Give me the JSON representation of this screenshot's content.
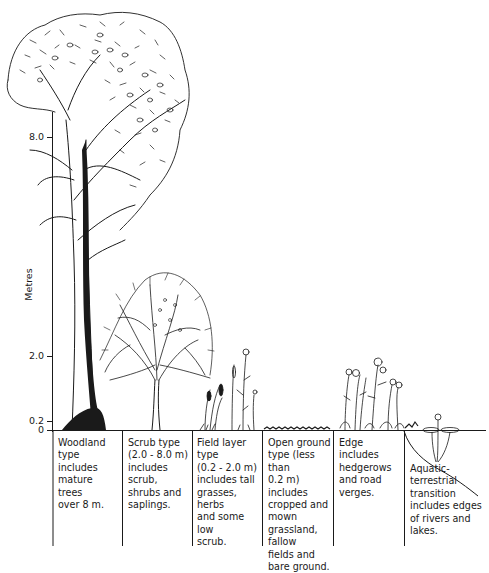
{
  "figure": {
    "axis": {
      "title": "Metres",
      "ticks": [
        {
          "label": "8.0",
          "y": 137
        },
        {
          "label": "2.0",
          "y": 356
        },
        {
          "label": "0.2",
          "y": 421
        },
        {
          "label": "0",
          "y": 430
        }
      ]
    },
    "habitat_types": [
      {
        "id": "woodland",
        "description": "Woodland type includes mature trees over 8 m.",
        "lines": [
          "Woodland",
          "type includes",
          "mature trees",
          "over 8 m."
        ]
      },
      {
        "id": "scrub",
        "description": "Scrub type (2.0 - 8.0 m) includes scrub, shrubs and saplings.",
        "lines": [
          "Scrub type",
          "(2.0 - 8.0 m)",
          "includes scrub,",
          "shrubs and",
          "saplings."
        ]
      },
      {
        "id": "field-layer",
        "description": "Field layer type (0.2 - 2.0 m) includes tall grasses, herbs and some low scrub.",
        "lines": [
          "Field layer type",
          "(0.2 - 2.0 m)",
          "includes tall",
          "grasses, herbs",
          "and some low",
          "scrub."
        ]
      },
      {
        "id": "open-ground",
        "description": "Open ground type (less than 0.2 m) includes cropped and mown grassland, fallow fields and bare ground.",
        "lines": [
          "Open ground",
          "type (less than",
          "0.2 m) includes",
          "cropped and",
          "mown",
          "grassland, fallow",
          "fields and",
          "bare ground."
        ]
      },
      {
        "id": "edge",
        "description": "Edge includes hedgerows and road verges.",
        "lines": [
          "Edge includes",
          "hedgerows",
          "and road",
          "verges."
        ]
      },
      {
        "id": "aquatic-terrestrial",
        "description": "Aquatic-terrestrial transition includes edges of rivers and lakes.",
        "lines": [
          "Aquatic-",
          "terrestrial",
          "transition",
          "includes edges",
          "of rivers and",
          "lakes."
        ]
      }
    ],
    "colors": {
      "ink": "#1a1a1a",
      "background": "#ffffff"
    }
  }
}
